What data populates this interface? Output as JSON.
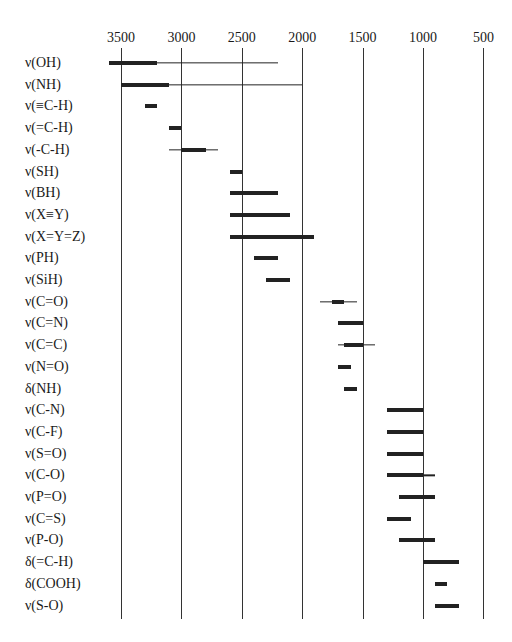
{
  "chart_data": {
    "type": "bar",
    "subtype": "horizontal range (IR absorption correlation chart)",
    "title": "",
    "xlabel": "",
    "ylabel": "",
    "x_ticks": [
      3500,
      3000,
      2500,
      2000,
      1500,
      1000,
      500
    ],
    "xlim": [
      3600,
      400
    ],
    "x_reversed": true,
    "grid": "vertical lines at each tick",
    "categories": [
      "ν(OH)",
      "ν(NH)",
      "ν(≡C-H)",
      "ν(=C-H)",
      "ν(-C-H)",
      "ν(SH)",
      "ν(BH)",
      "ν(X≡Y)",
      "ν(X=Y=Z)",
      "ν(PH)",
      "ν(SiH)",
      "ν(C=O)",
      "ν(C=N)",
      "ν(C=C)",
      "ν(N=O)",
      "δ(NH)",
      "ν(C-N)",
      "ν(C-F)",
      "ν(S=O)",
      "ν(C-O)",
      "ν(P=O)",
      "ν(C=S)",
      "ν(P-O)",
      "δ(=C-H)",
      "δ(COOH)",
      "ν(S-O)"
    ],
    "ranges": [
      {
        "label": "ν(OH)",
        "strong": [
          3600,
          3200
        ],
        "weak": [
          3600,
          2200
        ]
      },
      {
        "label": "ν(NH)",
        "strong": [
          3500,
          3100
        ],
        "weak": [
          3500,
          2000
        ]
      },
      {
        "label": "ν(≡C-H)",
        "strong": [
          3300,
          3200
        ],
        "weak": null
      },
      {
        "label": "ν(=C-H)",
        "strong": [
          3100,
          3000
        ],
        "weak": null
      },
      {
        "label": "ν(-C-H)",
        "strong": [
          3000,
          2800
        ],
        "weak": [
          3100,
          2700
        ]
      },
      {
        "label": "ν(SH)",
        "strong": [
          2600,
          2500
        ],
        "weak": null
      },
      {
        "label": "ν(BH)",
        "strong": [
          2600,
          2200
        ],
        "weak": null
      },
      {
        "label": "ν(X≡Y)",
        "strong": [
          2600,
          2100
        ],
        "weak": null
      },
      {
        "label": "ν(X=Y=Z)",
        "strong": [
          2600,
          1900
        ],
        "weak": null
      },
      {
        "label": "ν(PH)",
        "strong": [
          2400,
          2200
        ],
        "weak": null
      },
      {
        "label": "ν(SiH)",
        "strong": [
          2300,
          2100
        ],
        "weak": null
      },
      {
        "label": "ν(C=O)",
        "strong": [
          1750,
          1650
        ],
        "weak": [
          1850,
          1550
        ]
      },
      {
        "label": "ν(C=N)",
        "strong": [
          1700,
          1500
        ],
        "weak": null
      },
      {
        "label": "ν(C=C)",
        "strong": [
          1650,
          1500
        ],
        "weak": [
          1700,
          1400
        ]
      },
      {
        "label": "ν(N=O)",
        "strong": [
          1700,
          1600
        ],
        "weak": null
      },
      {
        "label": "δ(NH)",
        "strong": [
          1650,
          1550
        ],
        "weak": null
      },
      {
        "label": "ν(C-N)",
        "strong": [
          1300,
          1000
        ],
        "weak": null
      },
      {
        "label": "ν(C-F)",
        "strong": [
          1300,
          1000
        ],
        "weak": null
      },
      {
        "label": "ν(S=O)",
        "strong": [
          1300,
          1000
        ],
        "weak": null
      },
      {
        "label": "ν(C-O)",
        "strong": [
          1300,
          1000
        ],
        "weak": [
          1300,
          900
        ]
      },
      {
        "label": "ν(P=O)",
        "strong": [
          1200,
          900
        ],
        "weak": null
      },
      {
        "label": "ν(C=S)",
        "strong": [
          1300,
          1100
        ],
        "weak": null
      },
      {
        "label": "ν(P-O)",
        "strong": [
          1200,
          900
        ],
        "weak": null
      },
      {
        "label": "δ(=C-H)",
        "strong": [
          1000,
          700
        ],
        "weak": null
      },
      {
        "label": "δ(COOH)",
        "strong": [
          900,
          800
        ],
        "weak": null
      },
      {
        "label": "ν(S-O)",
        "strong": [
          900,
          700
        ],
        "weak": null
      }
    ],
    "legend": null
  },
  "layout": {
    "x_origin_value": 3500,
    "x_origin_px": 121,
    "px_per_unit": 0.1208,
    "row_first_y": 63,
    "row_spacing": 21.7
  }
}
